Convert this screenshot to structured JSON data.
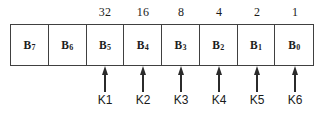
{
  "diagram": {
    "colors": {
      "box_border": "#404040",
      "arrow": "#2b2b2b",
      "text": "#1a1a1a",
      "background": "#ffffff"
    },
    "cells": [
      {
        "label": "B7",
        "base": "B",
        "subscript": "",
        "weight": "",
        "key": ""
      },
      {
        "label": "B6",
        "base": "B",
        "subscript": "6",
        "weight": "",
        "key": ""
      },
      {
        "label": "B5",
        "base": "B",
        "subscript": "5",
        "weight": "32",
        "key": "K1"
      },
      {
        "label": "B4",
        "base": "B",
        "subscript": "4",
        "weight": "16",
        "key": "K2"
      },
      {
        "label": "B3",
        "base": "B",
        "subscript": "3",
        "weight": "8",
        "key": "K3"
      },
      {
        "label": "B2",
        "base": "B",
        "subscript": "2",
        "weight": "4",
        "key": "K4"
      },
      {
        "label": "B1",
        "base": "B",
        "subscript": "1",
        "weight": "2",
        "key": "K5"
      },
      {
        "label": "B0",
        "base": "B",
        "subscript": "0",
        "weight": "1",
        "key": "K6"
      }
    ]
  }
}
